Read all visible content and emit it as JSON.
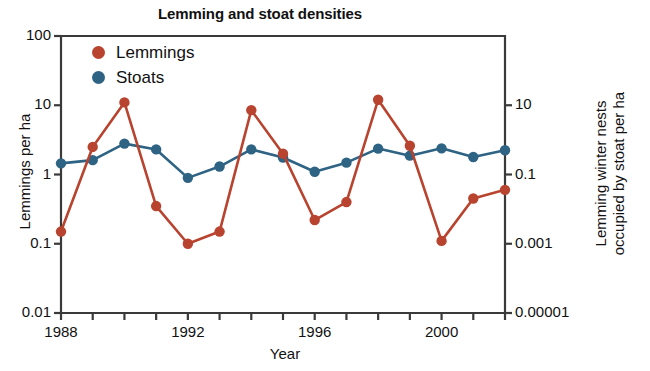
{
  "chart_data": {
    "type": "line",
    "title": "Lemming and stoat densities",
    "xlabel": "Year",
    "ylabel": "Lemmings per ha",
    "ylabel_right_line1": "Lemming winter nests",
    "ylabel_right_line2": "occupied by stoat per ha",
    "grid": false,
    "legend_position": "top-left",
    "xlim": [
      1988,
      2002
    ],
    "xticks": [
      1988,
      1989,
      1990,
      1991,
      1992,
      1993,
      1994,
      1995,
      1996,
      1997,
      1998,
      1999,
      2000,
      2001,
      2002
    ],
    "xticklabels": [
      "1988",
      "",
      "",
      "",
      "1992",
      "",
      "",
      "",
      "1996",
      "",
      "",
      "",
      "2000",
      "",
      ""
    ],
    "xticklabels_shown": [
      "1988",
      "1992",
      "1996",
      "2000"
    ],
    "ylim_left": [
      0.01,
      100
    ],
    "yticks_left": [
      0.01,
      0.1,
      1,
      10,
      100
    ],
    "yticklabels_left": [
      "0.01",
      "0.1",
      "1",
      "10",
      "100"
    ],
    "ylim_right": [
      1e-05,
      1000
    ],
    "yticks_right": [
      1e-05,
      0.001,
      0.1,
      10
    ],
    "yticklabels_right": [
      "0.00001",
      "0.001",
      "0.1",
      "10"
    ],
    "x": [
      1988,
      1989,
      1990,
      1991,
      1992,
      1993,
      1994,
      1995,
      1996,
      1997,
      1998,
      1999,
      2000,
      2001,
      2002
    ],
    "series": [
      {
        "name": "Lemmings",
        "color": "#b8432e",
        "axis": "left",
        "values": [
          0.15,
          2.5,
          11,
          0.35,
          0.1,
          0.15,
          8.5,
          2.0,
          0.22,
          0.4,
          12,
          2.6,
          0.11,
          0.45,
          0.6
        ]
      },
      {
        "name": "Stoats",
        "color": "#2e6384",
        "axis": "right",
        "values": [
          0.21,
          0.26,
          0.78,
          0.53,
          0.08,
          0.17,
          0.53,
          0.31,
          0.12,
          0.22,
          0.56,
          0.35,
          0.57,
          0.32,
          0.5
        ]
      }
    ]
  },
  "legend": {
    "items": [
      {
        "label": "Lemmings",
        "color": "#b8432e"
      },
      {
        "label": "Stoats",
        "color": "#2e6384"
      }
    ]
  }
}
